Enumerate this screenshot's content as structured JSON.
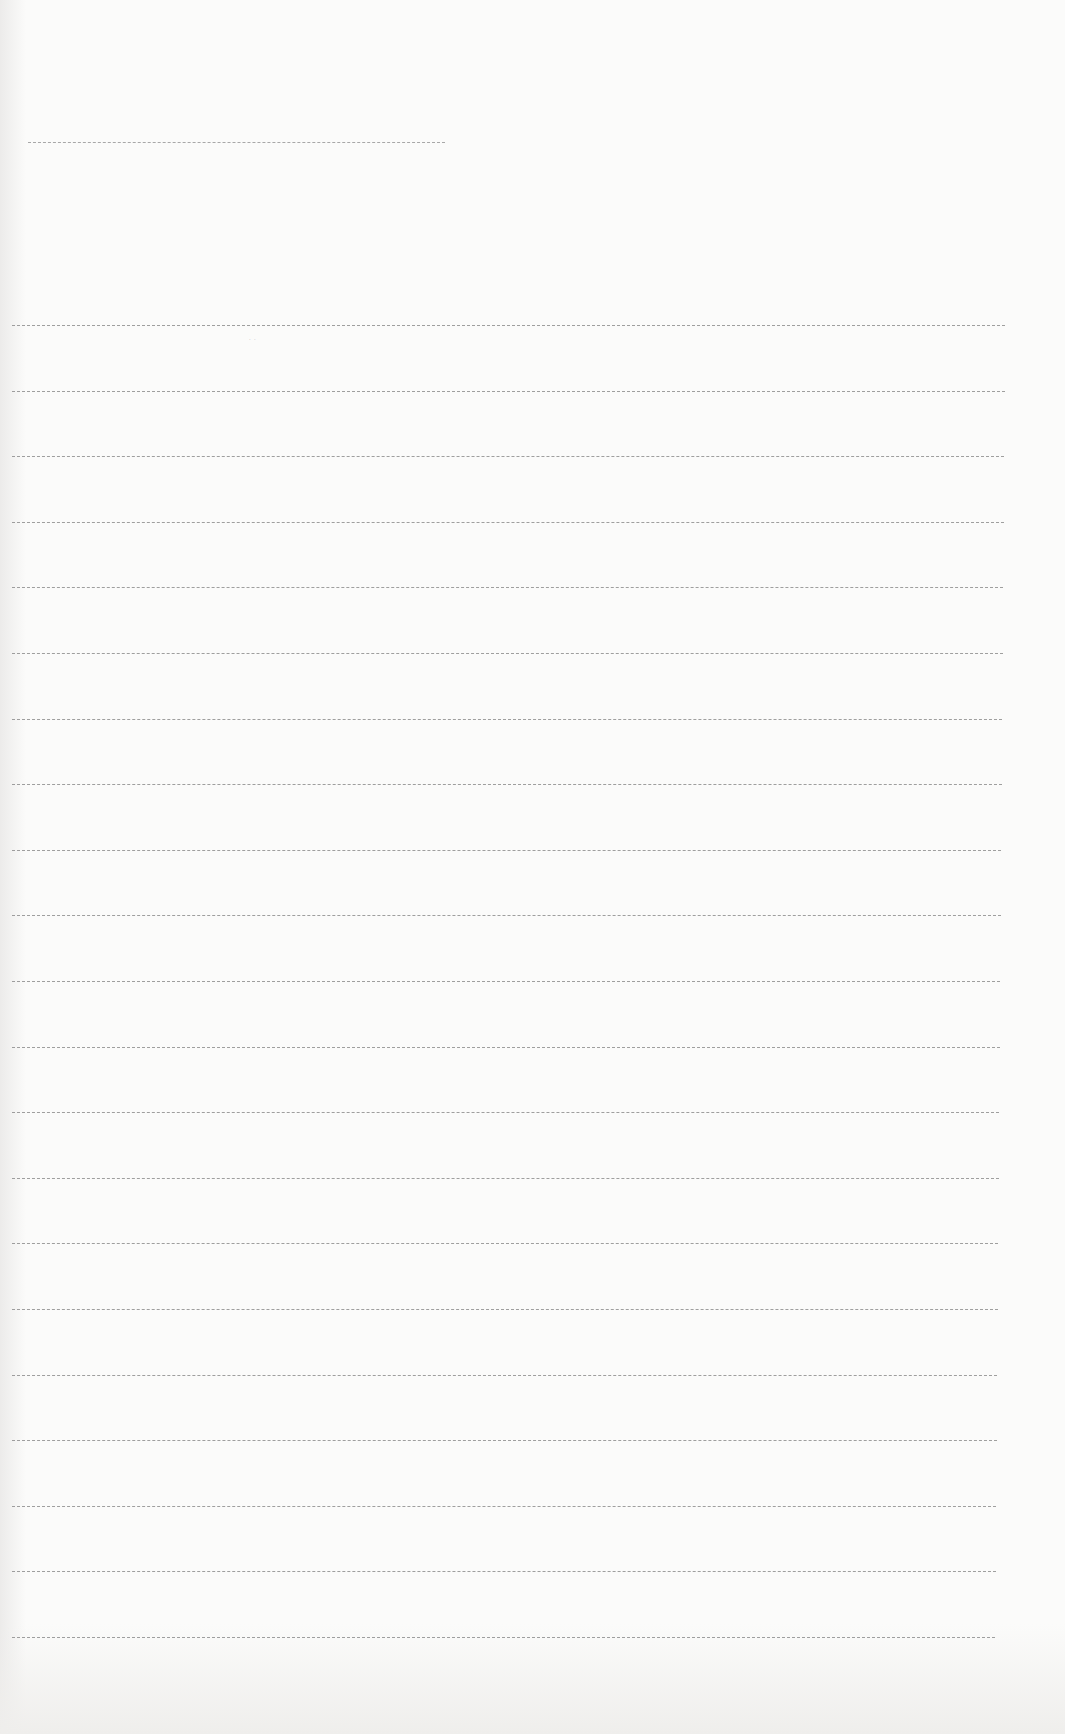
{
  "page": {
    "type": "blank ruled sheet (scanned)",
    "background": "#fbfbfa",
    "line_color": "#8f8f8f"
  },
  "title_line": {
    "x": 28,
    "y": 142,
    "width": 417
  },
  "ruled_lines": {
    "count": 21,
    "x": 12,
    "width": 993,
    "first_y": 325,
    "spacing": 65.6
  },
  "stray_mark": {
    "x": 249,
    "y": 336,
    "text": "· ·"
  }
}
